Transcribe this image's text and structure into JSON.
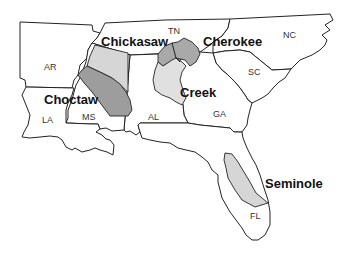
{
  "map": {
    "title": "Southeastern Native American Nations",
    "states": [
      {
        "abbr": "AR"
      },
      {
        "abbr": "TN"
      },
      {
        "abbr": "NC"
      },
      {
        "abbr": "SC"
      },
      {
        "abbr": "GA"
      },
      {
        "abbr": "AL"
      },
      {
        "abbr": "MS"
      },
      {
        "abbr": "LA"
      },
      {
        "abbr": "FL"
      }
    ],
    "nations": [
      {
        "name": "Chickasaw",
        "shade": "#d6d6d6"
      },
      {
        "name": "Cherokee",
        "shade": "#a9a9a9"
      },
      {
        "name": "Choctaw",
        "shade": "#9d9d9d"
      },
      {
        "name": "Creek",
        "shade": "#e0e0e0"
      },
      {
        "name": "Seminole",
        "shade": "#d6d6d6"
      }
    ]
  }
}
